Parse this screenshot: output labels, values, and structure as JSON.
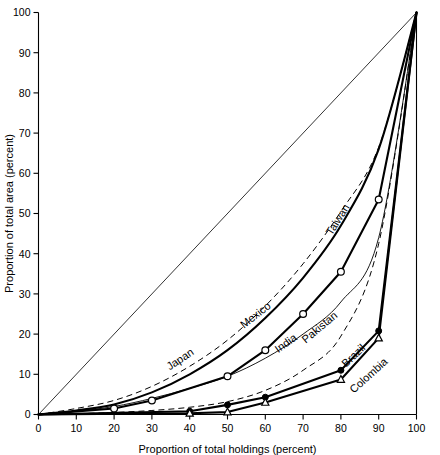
{
  "chart_data": {
    "type": "line",
    "title": "",
    "xlabel": "Proportion of total holdings (percent)",
    "ylabel": "Proportion of total area (percent)",
    "xlim": [
      0,
      100
    ],
    "ylim": [
      0,
      100
    ],
    "xticks": [
      0,
      10,
      20,
      30,
      40,
      50,
      60,
      70,
      80,
      90,
      100
    ],
    "yticks": [
      0,
      10,
      20,
      30,
      40,
      50,
      60,
      70,
      80,
      90,
      100
    ],
    "grid": false,
    "legend_position": "inline-labels",
    "annotations": [
      {
        "text": "Japan",
        "x": 38,
        "y": 13,
        "rotation": -34
      },
      {
        "text": "Mexico",
        "x": 58,
        "y": 24,
        "rotation": -38
      },
      {
        "text": "India",
        "x": 66,
        "y": 17,
        "rotation": -36
      },
      {
        "text": "Pakistan",
        "x": 75,
        "y": 21,
        "rotation": -40
      },
      {
        "text": "Taiwan",
        "x": 80,
        "y": 48,
        "rotation": -58
      },
      {
        "text": "Brazil",
        "x": 84,
        "y": 14,
        "rotation": -44
      },
      {
        "text": "Colombia",
        "x": 88,
        "y": 9,
        "rotation": -42
      }
    ],
    "reference_line": {
      "name": "line-of-equality",
      "x": [
        0,
        100
      ],
      "y": [
        0,
        100
      ],
      "style": "thin-solid"
    },
    "series": [
      {
        "name": "Japan",
        "style": "heavy-solid",
        "marker": "none",
        "x": [
          0,
          10,
          20,
          30,
          40,
          50,
          60,
          70,
          80,
          90,
          100
        ],
        "y": [
          0,
          1.0,
          2.5,
          5.5,
          10.0,
          16.0,
          24.0,
          34.0,
          47.0,
          66.0,
          100
        ]
      },
      {
        "name": "Taiwan",
        "style": "dashed",
        "marker": "none",
        "x": [
          0,
          10,
          20,
          30,
          40,
          50,
          60,
          70,
          80,
          90,
          100
        ],
        "y": [
          0,
          1.5,
          3.5,
          7.0,
          12.0,
          18.5,
          27.0,
          37.5,
          50.5,
          66.5,
          100
        ]
      },
      {
        "name": "Mexico",
        "style": "thin-solid",
        "marker": "none",
        "x": [
          0,
          10,
          20,
          30,
          40,
          50,
          60,
          70,
          80,
          90,
          100
        ],
        "y": [
          0,
          0.8,
          2.0,
          4.0,
          6.5,
          9.5,
          14.0,
          20.0,
          28.0,
          44.0,
          100
        ]
      },
      {
        "name": "India",
        "style": "heavy-solid",
        "marker": "open-circle",
        "x": [
          0,
          20,
          30,
          50,
          60,
          70,
          80,
          90,
          100
        ],
        "y": [
          0,
          1.5,
          3.5,
          9.5,
          16.0,
          25.0,
          35.5,
          53.5,
          100
        ]
      },
      {
        "name": "Pakistan",
        "style": "dashed",
        "marker": "none",
        "x": [
          0,
          10,
          20,
          30,
          40,
          50,
          60,
          70,
          80,
          90,
          100
        ],
        "y": [
          0,
          0.2,
          0.5,
          1.0,
          1.8,
          3.2,
          6.0,
          11.0,
          19.5,
          42.5,
          100
        ]
      },
      {
        "name": "Brazil",
        "style": "heavy-solid",
        "marker": "filled-circle",
        "x": [
          0,
          40,
          50,
          60,
          80,
          90,
          100
        ],
        "y": [
          0,
          0.8,
          2.4,
          4.3,
          11.0,
          20.8,
          100
        ]
      },
      {
        "name": "Colombia",
        "style": "heavy-solid",
        "marker": "open-triangle",
        "x": [
          0,
          40,
          50,
          60,
          80,
          90,
          100
        ],
        "y": [
          0,
          0.3,
          0.6,
          3.0,
          8.7,
          19.0,
          100
        ]
      }
    ]
  },
  "axes": {
    "x_tick_labels": [
      "0",
      "10",
      "20",
      "30",
      "40",
      "50",
      "60",
      "70",
      "80",
      "90",
      "100"
    ],
    "y_tick_labels": [
      "0",
      "10",
      "20",
      "30",
      "40",
      "50",
      "60",
      "70",
      "80",
      "90",
      "100"
    ],
    "x_axis_title": "Proportion of total holdings (percent)",
    "y_axis_title": "Proportion of total area (percent)"
  },
  "labels": {
    "japan": "Japan",
    "mexico": "Mexico",
    "india": "India",
    "pakistan": "Pakistan",
    "taiwan": "Taiwan",
    "brazil": "Brazil",
    "colombia": "Colombia"
  },
  "colors": {
    "background": "#ffffff",
    "ink": "#000000"
  }
}
